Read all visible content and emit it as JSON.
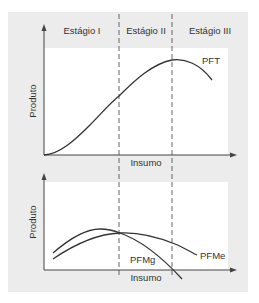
{
  "stages": [
    {
      "label": "Estágio I"
    },
    {
      "label": "Estágio II"
    },
    {
      "label": "Estágio III"
    }
  ],
  "top_chart": {
    "ylabel": "Produto",
    "xlabel": "Insumo",
    "curves": [
      {
        "label": "PFT"
      }
    ]
  },
  "bottom_chart": {
    "ylabel": "Produto",
    "xlabel": "Insumo",
    "curves": [
      {
        "label": "PFMg"
      },
      {
        "label": "PFMe"
      }
    ]
  },
  "colors": {
    "panel": "#ececec",
    "plot": "#ffffff",
    "line": "#333333",
    "dash": "#555555"
  }
}
